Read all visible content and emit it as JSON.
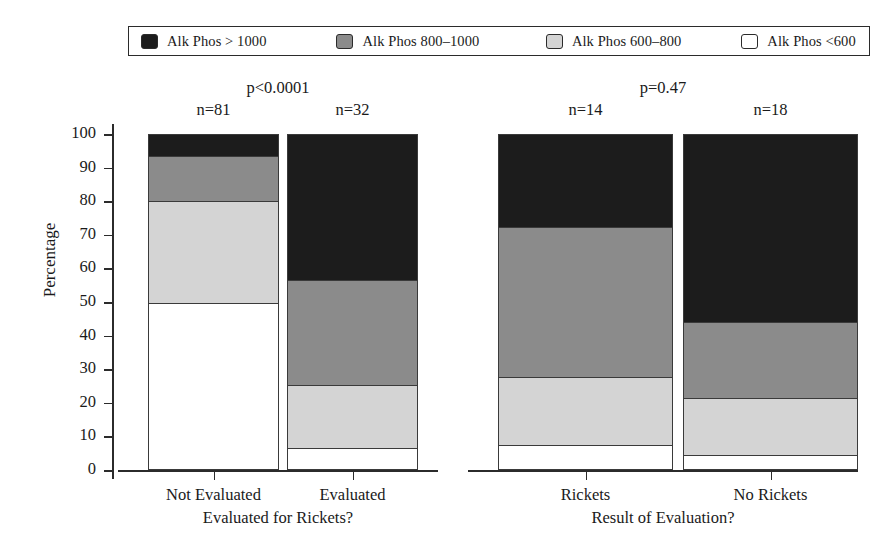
{
  "legend": {
    "items": [
      {
        "label": "Alk Phos > 1000",
        "color": "#1c1c1c"
      },
      {
        "label": "Alk Phos 800–1000",
        "color": "#8b8b8b"
      },
      {
        "label": "Alk Phos 600–800",
        "color": "#d4d4d4"
      },
      {
        "label": "Alk Phos <600",
        "color": "#ffffff"
      }
    ]
  },
  "chart_data": {
    "type": "bar",
    "subtype": "stacked-100-percent",
    "title": "",
    "xlabel": "",
    "ylabel": "Percentage",
    "ylim": [
      0,
      100
    ],
    "yticks": [
      0,
      10,
      20,
      30,
      40,
      50,
      60,
      70,
      80,
      90,
      100
    ],
    "grid": true,
    "legend_position": "top",
    "series": [
      {
        "name": "Alk Phos > 1000",
        "color": "#1c1c1c",
        "values": [
          6.6,
          43.4,
          27.8,
          55.9
        ]
      },
      {
        "name": "Alk Phos 800–1000",
        "color": "#8b8b8b",
        "values": [
          13.4,
          31.3,
          44.5,
          22.6
        ]
      },
      {
        "name": "Alk Phos 600–800",
        "color": "#d4d4d4",
        "values": [
          30.4,
          18.7,
          20.2,
          17.1
        ]
      },
      {
        "name": "Alk Phos <600",
        "color": "#ffffff",
        "values": [
          49.6,
          6.6,
          7.5,
          4.4
        ]
      }
    ],
    "panels": [
      {
        "name": "evaluated-for-rickets",
        "axis_title": "Evaluated for Rickets?",
        "pvalue": "p<0.0001",
        "categories": [
          {
            "label": "Not Evaluated",
            "n": "n=81"
          },
          {
            "label": "Evaluated",
            "n": "n=32"
          }
        ]
      },
      {
        "name": "result-of-evaluation",
        "axis_title": "Result of Evaluation?",
        "pvalue": "p=0.47",
        "categories": [
          {
            "label": "Rickets",
            "n": "n=14"
          },
          {
            "label": "No Rickets",
            "n": "n=18"
          }
        ]
      }
    ]
  }
}
